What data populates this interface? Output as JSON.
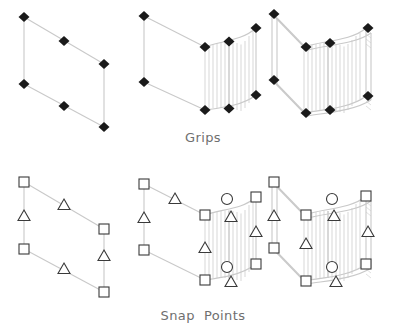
{
  "figure": {
    "background": "#ffffff",
    "line_color": "#c9c9c9",
    "hatch_color": "#d2d2d2",
    "marker_fill": "#1a1a1a",
    "marker_outline": "#3a3a3a",
    "caption_color": "#6f6f6f"
  },
  "captions": {
    "grips": "Grips",
    "snap_points": "Snap  Points"
  },
  "rows": [
    {
      "id": "grips-row",
      "label": "Grips",
      "marker_type": "diamond",
      "marker_semantic": "grip-diamond-marker",
      "panels": [
        {
          "id": "grips-flat-wall",
          "name": "flat-wall-grips",
          "geometry": "parallelogram",
          "curved": false,
          "solid": false,
          "marker_count": 6
        },
        {
          "id": "grips-curved-wall",
          "name": "curved-wall-grips",
          "geometry": "parallelogram-with-arc",
          "curved": true,
          "solid": false,
          "marker_count": 8
        },
        {
          "id": "grips-solid-wall",
          "name": "solid-curved-wall-grips",
          "geometry": "parallelogram-with-arc-thickness",
          "curved": true,
          "solid": true,
          "marker_count": 8
        }
      ]
    },
    {
      "id": "snap-row",
      "label": "Snap  Points",
      "marker_types": [
        "square",
        "triangle",
        "circle"
      ],
      "marker_semantics": {
        "square": "endpoint-snap-marker",
        "triangle": "midpoint-snap-marker",
        "circle": "center-snap-marker"
      },
      "panels": [
        {
          "id": "snap-flat-wall",
          "name": "flat-wall-snap-points",
          "geometry": "parallelogram",
          "curved": false,
          "solid": false,
          "squares": 4,
          "triangles": 4,
          "circles": 0
        },
        {
          "id": "snap-curved-wall",
          "name": "curved-wall-snap-points",
          "geometry": "parallelogram-with-arc",
          "curved": true,
          "solid": false,
          "squares": 6,
          "triangles": 6,
          "circles": 2
        },
        {
          "id": "snap-solid-wall",
          "name": "solid-curved-wall-snap-points",
          "geometry": "parallelogram-with-arc-thickness",
          "curved": true,
          "solid": true,
          "squares": 6,
          "triangles": 6,
          "circles": 2
        }
      ]
    }
  ]
}
